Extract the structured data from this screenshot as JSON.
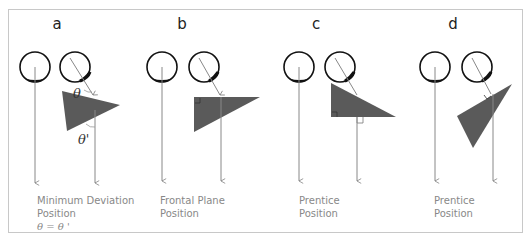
{
  "panels": [
    {
      "letter": "a",
      "caption_line1": "Minimum Deviation",
      "caption_line2": "Position",
      "caption_line3": "θ = θ '",
      "angle_labels": [
        "θ",
        "θ'"
      ]
    },
    {
      "letter": "b",
      "caption_line1": "Frontal Plane",
      "caption_line2": "Position"
    },
    {
      "letter": "c",
      "caption_line1": "Prentice",
      "caption_line2": "Position"
    },
    {
      "letter": "d",
      "caption_line1": "Prentice",
      "caption_line2": "Position"
    }
  ],
  "colors": {
    "prism_fill": "#5a5a5a",
    "ray": "#888888",
    "eye_outline": "#111111",
    "frame": "#c8c8c8",
    "caption": "#888888"
  }
}
